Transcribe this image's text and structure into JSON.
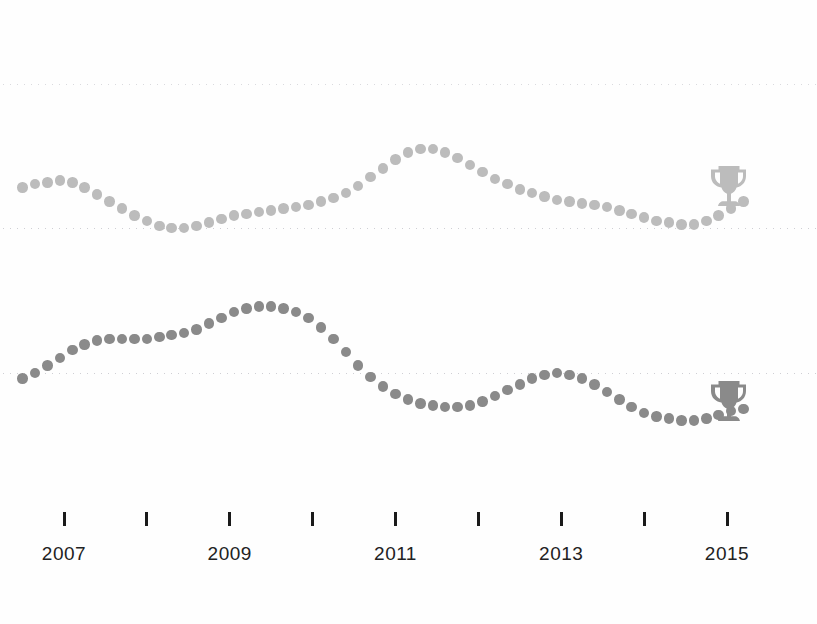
{
  "chart_data": [
    {
      "type": "line",
      "name": "top-series",
      "title": "",
      "xlabel": "",
      "ylabel": "",
      "marker": "dotted",
      "color": "#bcbcbc",
      "grid": true,
      "legend": "none",
      "xlim": [
        2006.5,
        2015.4
      ],
      "ylim": [
        0,
        100
      ],
      "gridline_values": [
        100,
        18
      ],
      "annotation_icon": "trophy-icon",
      "x": [
        2006.5,
        2006.65,
        2006.8,
        2006.95,
        2007.1,
        2007.25,
        2007.4,
        2007.55,
        2007.7,
        2007.85,
        2008.0,
        2008.15,
        2008.3,
        2008.45,
        2008.6,
        2008.75,
        2008.9,
        2009.05,
        2009.2,
        2009.35,
        2009.5,
        2009.65,
        2009.8,
        2009.95,
        2010.1,
        2010.25,
        2010.4,
        2010.55,
        2010.7,
        2010.85,
        2011.0,
        2011.15,
        2011.3,
        2011.45,
        2011.6,
        2011.75,
        2011.9,
        2012.05,
        2012.2,
        2012.35,
        2012.5,
        2012.65,
        2012.8,
        2012.95,
        2013.1,
        2013.25,
        2013.4,
        2013.55,
        2013.7,
        2013.85,
        2014.0,
        2014.15,
        2014.3,
        2014.45,
        2014.6,
        2014.75,
        2014.9,
        2015.05,
        2015.2
      ],
      "values": [
        41,
        43,
        44,
        45,
        44,
        41,
        37,
        33,
        29,
        25,
        22,
        19,
        18,
        18,
        19,
        21,
        23,
        25,
        26,
        27,
        28,
        29,
        30,
        31,
        33,
        35,
        38,
        42,
        47,
        52,
        57,
        61,
        63,
        63,
        61,
        58,
        54,
        50,
        46,
        43,
        40,
        38,
        36,
        34,
        33,
        32,
        31,
        30,
        28,
        26,
        24,
        22,
        21,
        20,
        20,
        22,
        25,
        29,
        33
      ]
    },
    {
      "type": "line",
      "name": "bottom-series",
      "title": "",
      "xlabel": "",
      "ylabel": "",
      "marker": "dotted",
      "color": "#8a8a8a",
      "grid": true,
      "legend": "none",
      "xlim": [
        2006.5,
        2015.4
      ],
      "ylim": [
        0,
        100
      ],
      "gridline_values": [
        50
      ],
      "annotation_icon": "trophy-icon",
      "x": [
        2006.5,
        2006.65,
        2006.8,
        2006.95,
        2007.1,
        2007.25,
        2007.4,
        2007.55,
        2007.7,
        2007.85,
        2008.0,
        2008.15,
        2008.3,
        2008.45,
        2008.6,
        2008.75,
        2008.9,
        2009.05,
        2009.2,
        2009.35,
        2009.5,
        2009.65,
        2009.8,
        2009.95,
        2010.1,
        2010.25,
        2010.4,
        2010.55,
        2010.7,
        2010.85,
        2011.0,
        2011.15,
        2011.3,
        2011.45,
        2011.6,
        2011.75,
        2011.9,
        2012.05,
        2012.2,
        2012.35,
        2012.5,
        2012.65,
        2012.8,
        2012.95,
        2013.1,
        2013.25,
        2013.4,
        2013.55,
        2013.7,
        2013.85,
        2014.0,
        2014.15,
        2014.3,
        2014.45,
        2014.6,
        2014.75,
        2014.9,
        2015.05,
        2015.2
      ],
      "values": [
        47,
        50,
        54,
        58,
        62,
        65,
        67,
        68,
        68,
        68,
        68,
        69,
        70,
        71,
        73,
        76,
        79,
        82,
        84,
        85,
        85,
        84,
        82,
        79,
        74,
        68,
        61,
        54,
        48,
        43,
        39,
        36,
        34,
        33,
        32,
        32,
        33,
        35,
        38,
        41,
        44,
        47,
        49,
        50,
        49,
        47,
        44,
        40,
        36,
        32,
        29,
        27,
        26,
        25,
        25,
        26,
        28,
        30,
        31
      ]
    }
  ],
  "axis": {
    "ticks": [
      2007,
      2008,
      2009,
      2010,
      2011,
      2012,
      2013,
      2014,
      2015
    ],
    "labels": [
      {
        "year": "2007",
        "value": 2007
      },
      {
        "year": "2009",
        "value": 2009
      },
      {
        "year": "2011",
        "value": 2011
      },
      {
        "year": "2013",
        "value": 2013
      },
      {
        "year": "2015",
        "value": 2015
      }
    ]
  },
  "icons": {
    "trophy": "trophy-icon"
  },
  "colors": {
    "top_series": "#bcbcbc",
    "bottom_series": "#8a8a8a",
    "gridline": "#cfcfd4",
    "tick": "#1a1a1a",
    "label": "#222222",
    "background": "#fefefe"
  }
}
